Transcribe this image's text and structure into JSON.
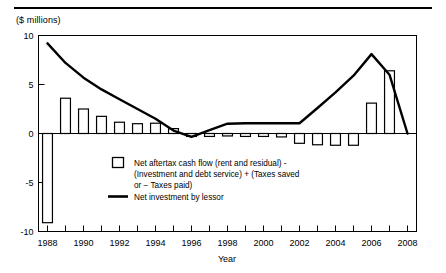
{
  "figure": {
    "unit_label": "($ millions)",
    "x_axis_title": "Year"
  },
  "legend": {
    "bar_entry_line1": "Net aftertax cash flow (rent and residual) -",
    "bar_entry_line2": "(Investment and debt service)  +  (Taxes saved",
    "bar_entry_line3": "or  −  Taxes paid)",
    "line_entry": "Net investment by lessor"
  },
  "colors": {
    "ink": "#000000",
    "background": "#ffffff"
  },
  "chart_data": {
    "type": "bar",
    "title": "",
    "subtitle": "",
    "xlabel": "Year",
    "ylabel": "($ millions)",
    "xlim": [
      1987.5,
      2008.5
    ],
    "ylim": [
      -10,
      10
    ],
    "yticks": [
      -10,
      -5,
      0,
      5,
      10
    ],
    "ytick_labels": [
      "-10",
      "-5",
      "0",
      "5",
      "10"
    ],
    "xticks": [
      1988,
      1989,
      1990,
      1991,
      1992,
      1993,
      1994,
      1995,
      1996,
      1997,
      1998,
      1999,
      2000,
      2001,
      2002,
      2003,
      2004,
      2005,
      2006,
      2007,
      2008
    ],
    "xtick_labels_shown": [
      "1988",
      "1990",
      "1992",
      "1994",
      "1996",
      "1998",
      "2000",
      "2002",
      "2004",
      "2006",
      "2008"
    ],
    "grid": false,
    "legend_position": "inside-center-lower",
    "categories": [
      1988,
      1989,
      1990,
      1991,
      1992,
      1993,
      1994,
      1995,
      1996,
      1997,
      1998,
      1999,
      2000,
      2001,
      2002,
      2003,
      2004,
      2005,
      2006,
      2007,
      2008
    ],
    "series": [
      {
        "name": "Net aftertax cash flow (rent and residual) - (Investment and debt service) + (Taxes saved or - Taxes paid)",
        "type": "bar",
        "values": [
          -9.1,
          3.6,
          2.5,
          1.75,
          1.15,
          1.0,
          1.05,
          0.5,
          -0.3,
          -0.3,
          -0.25,
          -0.3,
          -0.3,
          -0.35,
          -1.0,
          -1.15,
          -1.2,
          -1.2,
          3.1,
          6.4,
          0.0
        ]
      },
      {
        "name": "Net investment by lessor",
        "type": "line",
        "values": [
          9.2,
          7.2,
          5.7,
          4.5,
          3.5,
          2.5,
          1.5,
          0.3,
          -0.35,
          0.35,
          1.0,
          1.05,
          1.05,
          1.05,
          1.05,
          2.6,
          4.2,
          5.9,
          8.1,
          6.0,
          0.0
        ]
      }
    ]
  }
}
